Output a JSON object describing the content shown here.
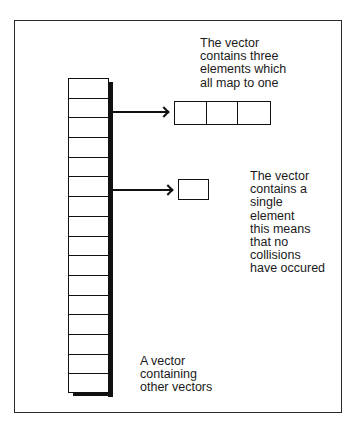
{
  "diagram": {
    "title": "",
    "outer_vector": {
      "cell_count": 16,
      "caption_lines": [
        "A vector",
        "containing",
        "other vectors"
      ]
    },
    "top_inner_vector": {
      "cell_count": 3,
      "caption_lines": [
        "The vector",
        "contains three",
        "elements which",
        "all map to one"
      ]
    },
    "bottom_inner_vector": {
      "cell_count": 1,
      "caption_lines": [
        "The vector",
        "contains a",
        "single",
        "element",
        "this means",
        "that no",
        "collisions",
        "have occured"
      ]
    },
    "arrows": [
      {
        "from": "outer_vector_cell_2",
        "to": "top_inner_vector"
      },
      {
        "from": "outer_vector_cell_6",
        "to": "bottom_inner_vector"
      }
    ],
    "colors": {
      "line": "#111111",
      "background": "#ffffff",
      "text": "#1a1a1a"
    }
  }
}
